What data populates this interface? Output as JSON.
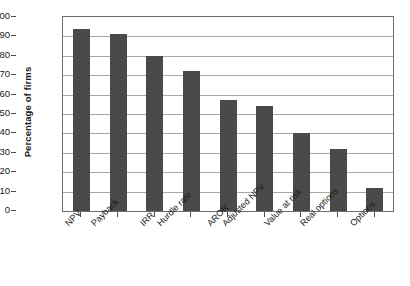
{
  "chart_data": {
    "type": "bar",
    "title": "",
    "subtitle": "",
    "xlabel": "",
    "ylabel": "Percentage of firms",
    "ylim": [
      0,
      100
    ],
    "yticks": [
      0,
      10,
      20,
      30,
      40,
      50,
      60,
      70,
      80,
      90,
      100
    ],
    "ytick_labels": [
      "0",
      "10",
      "20",
      "30",
      "40",
      "50",
      "60",
      "70",
      "80",
      "90",
      "100"
    ],
    "grid": true,
    "grid_axis": "y",
    "legend": false,
    "legend_position": "none",
    "categories": [
      "NPV",
      "Payback",
      "IRR",
      "Hurdle rate",
      "AROR",
      "Adjusted NPV",
      "Value at risk",
      "Real options",
      "Options"
    ],
    "values": [
      94,
      91,
      80,
      72,
      57,
      54,
      40,
      32,
      12
    ],
    "bar_color": "#4a4a4a",
    "gridline_color": "#a8a8a8",
    "axis_color": "#6d6d6d",
    "background_color": "#ffffff",
    "xtick_label_rotation": -45
  }
}
